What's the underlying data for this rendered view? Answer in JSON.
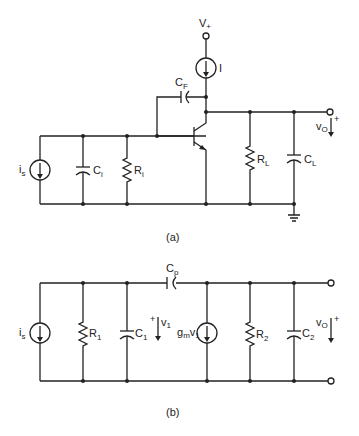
{
  "figure": {
    "subfigures": [
      {
        "caption": "(a)",
        "components": {
          "source": {
            "name": "i",
            "sub": "s"
          },
          "input_cap": {
            "name": "C",
            "sub": "i"
          },
          "input_res": {
            "name": "R",
            "sub": "i"
          },
          "feedback_cap": {
            "name": "C",
            "sub": "F"
          },
          "supply": {
            "name": "V",
            "sub": "+"
          },
          "bias_source": {
            "name": "I"
          },
          "load_res": {
            "name": "R",
            "sub": "L"
          },
          "load_cap": {
            "name": "C",
            "sub": "L"
          },
          "output": {
            "name": "v",
            "sub": "O",
            "polarity": "+"
          }
        }
      },
      {
        "caption": "(b)",
        "components": {
          "source": {
            "name": "i",
            "sub": "s"
          },
          "res1": {
            "name": "R",
            "sub": "1"
          },
          "cap1": {
            "name": "C",
            "sub": "1"
          },
          "v1": {
            "name": "v",
            "sub": "1",
            "polarity": "+"
          },
          "cp": {
            "name": "C",
            "sub": "p"
          },
          "gm_source": {
            "name": "g",
            "sub": "m",
            "name2": "v",
            "sub2": "1"
          },
          "res2": {
            "name": "R",
            "sub": "2"
          },
          "cap2": {
            "name": "C",
            "sub": "2"
          },
          "output": {
            "name": "v",
            "sub": "O",
            "polarity": "+"
          }
        }
      }
    ]
  }
}
